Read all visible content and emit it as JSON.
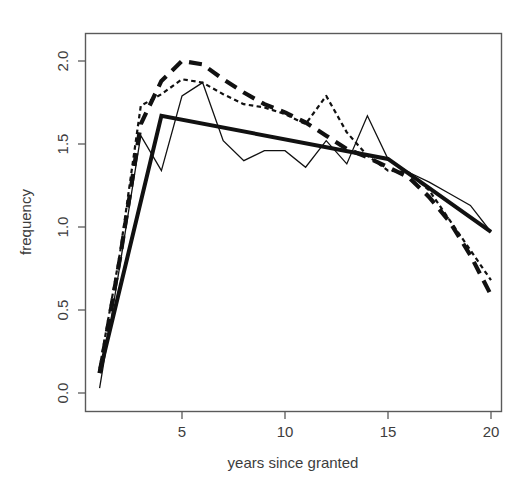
{
  "chart_data": {
    "type": "line",
    "title": "",
    "xlabel": "years since granted",
    "ylabel": "frequency",
    "xlim": [
      1,
      20
    ],
    "ylim": [
      0.0,
      2.05
    ],
    "grid": false,
    "legend": null,
    "xticks": [
      5,
      10,
      15,
      20
    ],
    "xtick_labels": [
      "5",
      "10",
      "15",
      "20"
    ],
    "yticks": [
      0.0,
      0.5,
      1.0,
      1.5,
      2.0
    ],
    "ytick_labels": [
      "0.0",
      "0.5",
      "1.0",
      "1.5",
      "2.0"
    ],
    "x": [
      1,
      2,
      3,
      4,
      5,
      6,
      7,
      8,
      9,
      10,
      11,
      12,
      13,
      14,
      15,
      16,
      17,
      18,
      19,
      20
    ],
    "series": [
      {
        "name": "observed frequency",
        "style": "thin-solid",
        "linewidth": 1.3,
        "color": "#111111",
        "values": [
          0.03,
          0.78,
          1.55,
          1.34,
          1.79,
          1.87,
          1.52,
          1.4,
          1.46,
          1.46,
          1.36,
          1.52,
          1.38,
          1.67,
          1.41,
          1.33,
          1.27,
          1.2,
          1.13,
          0.97
        ]
      },
      {
        "name": "dotted fit",
        "style": "dotted",
        "linewidth": 2.2,
        "color": "#111111",
        "values": [
          0.15,
          0.85,
          1.73,
          1.8,
          1.89,
          1.87,
          1.8,
          1.74,
          1.72,
          1.68,
          1.62,
          1.79,
          1.57,
          1.43,
          1.34,
          1.33,
          1.22,
          1.04,
          0.86,
          0.68
        ]
      },
      {
        "name": "dashed fit",
        "style": "dashed",
        "linewidth": 4.2,
        "color": "#111111",
        "values": [
          0.12,
          0.82,
          1.62,
          1.88,
          2.0,
          1.98,
          1.89,
          1.81,
          1.74,
          1.69,
          1.63,
          1.55,
          1.47,
          1.42,
          1.36,
          1.3,
          1.18,
          1.03,
          0.83,
          0.59
        ]
      },
      {
        "name": "piecewise linear fit",
        "style": "thick-solid",
        "linewidth": 4.0,
        "color": "#111111",
        "breakpoints": [
          1,
          4,
          15,
          20
        ],
        "breakpoint_values": [
          0.12,
          1.67,
          1.41,
          0.97
        ],
        "values": [
          0.12,
          0.64,
          1.16,
          1.67,
          1.65,
          1.63,
          1.6,
          1.58,
          1.56,
          1.53,
          1.51,
          1.49,
          1.46,
          1.44,
          1.41,
          1.32,
          1.23,
          1.15,
          1.06,
          0.97
        ]
      }
    ]
  },
  "axes": {
    "x_title": "years since granted",
    "y_title": "frequency"
  }
}
